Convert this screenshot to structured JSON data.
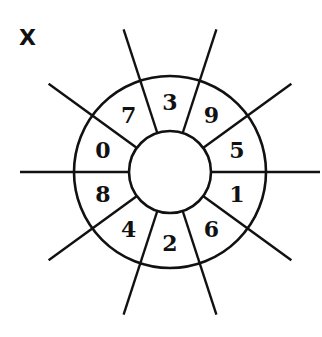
{
  "figure": {
    "label": "X",
    "stroke_color": "#111111",
    "background": "#ffffff"
  },
  "wheel": {
    "center": [
      170,
      172
    ],
    "inner_radius": 41,
    "outer_radius": 96,
    "spoke_radius": 150,
    "spoke_angles_deg": [
      0,
      36,
      72,
      108,
      144,
      180,
      216,
      252,
      288,
      324
    ],
    "sectors": [
      {
        "angle_deg": 90,
        "value": "3"
      },
      {
        "angle_deg": 54,
        "value": "9"
      },
      {
        "angle_deg": 18,
        "value": "5"
      },
      {
        "angle_deg": -18,
        "value": "1"
      },
      {
        "angle_deg": -54,
        "value": "6"
      },
      {
        "angle_deg": -90,
        "value": "2"
      },
      {
        "angle_deg": -126,
        "value": "4"
      },
      {
        "angle_deg": -162,
        "value": "8"
      },
      {
        "angle_deg": 162,
        "value": "0"
      },
      {
        "angle_deg": 126,
        "value": "7"
      }
    ]
  }
}
